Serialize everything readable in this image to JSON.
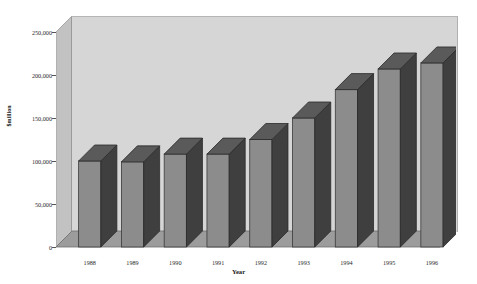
{
  "chart_data": {
    "type": "bar",
    "title": "",
    "subtitle": "",
    "xlabel": "Year",
    "ylabel": "$million",
    "categories": [
      "1988",
      "1989",
      "1990",
      "1991",
      "1992",
      "1993",
      "1994",
      "1995",
      "1996"
    ],
    "values": [
      100000,
      99000,
      108000,
      108000,
      125000,
      150000,
      183000,
      207000,
      214000
    ],
    "series": [
      {
        "name": "$million",
        "values": [
          100000,
          99000,
          108000,
          108000,
          125000,
          150000,
          183000,
          207000,
          214000
        ]
      }
    ],
    "ylim": [
      0,
      250000
    ],
    "ytick_values": [
      250000,
      200000,
      150000,
      100000,
      50000,
      0
    ],
    "ytick_labels": [
      "250,000",
      "200,000",
      "150,000",
      "100,000",
      "50,000",
      "0"
    ],
    "grid": false,
    "legend": "none",
    "style": "3d-column",
    "colors": {
      "bar_front": "#8c8c8c",
      "bar_side": "#3f3f3f",
      "bar_top": "#5a5a5a",
      "plot_background": "#d6d6d6",
      "floor": "#9c9c9c",
      "left_wall": "#c2c2c2",
      "axis_text": "#2a2a2a",
      "page_background": "#ffffff"
    }
  },
  "axes": {
    "y_title": "$million",
    "x_title": "Year"
  }
}
